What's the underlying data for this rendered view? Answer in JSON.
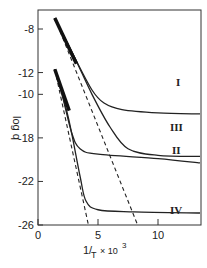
{
  "chart_data": {
    "type": "line",
    "title": "",
    "xlabel": "1/T × 10³",
    "ylabel": "log q",
    "xlim": [
      0,
      13.5
    ],
    "ylim": [
      -26,
      -6
    ],
    "x_ticks": [
      0,
      5,
      10
    ],
    "x_tick_labels": [
      "0",
      "5",
      "10"
    ],
    "y_ticks_positions": [
      -8,
      -12,
      -14,
      -18,
      -22,
      -26
    ],
    "y_tick_labels": [
      "-8",
      "-12",
      "-10",
      "-18",
      "-22",
      "-26"
    ],
    "grid": false,
    "legend": "inline labels at right",
    "series": [
      {
        "name": "I",
        "style": "solid",
        "x": [
          1.4,
          3.0,
          4.5,
          5.5,
          7.0,
          10.0,
          13.5
        ],
        "y": [
          -7.0,
          -10.5,
          -13.6,
          -14.8,
          -15.4,
          -15.7,
          -15.8
        ]
      },
      {
        "name": "III",
        "style": "solid",
        "x": [
          1.4,
          3.0,
          4.5,
          6.0,
          7.5,
          10.0,
          13.5
        ],
        "y": [
          -7.0,
          -10.5,
          -14.0,
          -17.0,
          -19.0,
          -19.6,
          -19.7
        ]
      },
      {
        "name": "II",
        "style": "solid",
        "x": [
          1.4,
          2.0,
          2.8,
          3.5,
          5.0,
          10.0,
          13.5
        ],
        "y": [
          -11.7,
          -14.0,
          -17.5,
          -19.0,
          -19.5,
          -19.9,
          -20.3
        ]
      },
      {
        "name": "IV",
        "style": "solid",
        "x": [
          1.4,
          2.5,
          3.5,
          4.0,
          5.0,
          8.0,
          13.5
        ],
        "y": [
          -11.7,
          -16.0,
          -21.5,
          -23.8,
          -24.6,
          -24.8,
          -24.9
        ]
      },
      {
        "name": "asymptote-upper",
        "style": "dashed",
        "x": [
          1.4,
          8.3
        ],
        "y": [
          -7.0,
          -26.0
        ]
      },
      {
        "name": "asymptote-lower",
        "style": "dashed",
        "x": [
          1.4,
          4.2
        ],
        "y": [
          -11.7,
          -26.0
        ]
      }
    ],
    "annotations": [
      "I",
      "III",
      "II",
      "IV"
    ]
  },
  "labels": {
    "ylabel": "log q",
    "xlabel_main": "1/",
    "xlabel_T": "T",
    "xlabel_suffix": "× 10",
    "xlabel_exp": "3",
    "curve_I": "I",
    "curve_III": "III",
    "curve_II": "II",
    "curve_IV": "IV"
  }
}
